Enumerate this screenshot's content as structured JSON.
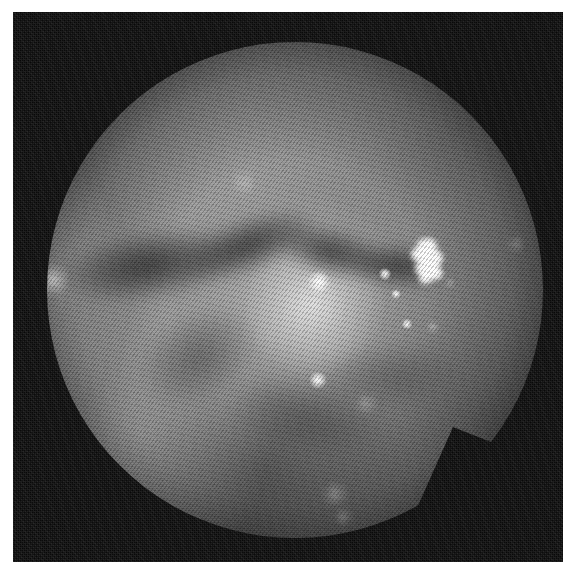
{
  "image": {
    "kind": "endoscopic-frame",
    "modality": "white-light endoscopy",
    "color_mode": "grayscale",
    "width": 575,
    "height": 574,
    "page_background": "#ffffff",
    "plate_background": "#0b0b0b",
    "tissue_base_color": "#939393",
    "highlight_color": "#ffffff",
    "shadow_color": "#181818"
  },
  "plate": {
    "left": 13,
    "top": 12,
    "width": 550,
    "height": 550
  },
  "field_of_view": {
    "shape": "circle-with-notch",
    "center_x": 282,
    "center_y": 278,
    "radius": 248,
    "notch": {
      "description": "angular wedge removed from the lower-right rim",
      "points": "440,415 478,430 462,470 498,452"
    }
  },
  "features": {
    "dark_bands": [
      {
        "name": "mucosal-fold-left",
        "x": 42,
        "y": 218,
        "w": 190,
        "h": 70,
        "rotate": -9
      },
      {
        "name": "mucosal-fold-mid",
        "x": 160,
        "y": 205,
        "w": 150,
        "h": 56,
        "rotate": -21
      },
      {
        "name": "mucosal-fold-crest",
        "x": 258,
        "y": 215,
        "w": 120,
        "h": 50,
        "rotate": 14
      },
      {
        "name": "mucosal-fold-right",
        "x": 330,
        "y": 232,
        "w": 110,
        "h": 44,
        "rotate": 6
      },
      {
        "name": "shadow-lower-left",
        "x": 120,
        "y": 300,
        "w": 130,
        "h": 90,
        "rotate": -30
      },
      {
        "name": "shadow-lower-center",
        "x": 215,
        "y": 365,
        "w": 160,
        "h": 80,
        "rotate": 10
      },
      {
        "name": "shadow-lower-right",
        "x": 300,
        "y": 330,
        "w": 150,
        "h": 70,
        "rotate": -6
      }
    ],
    "specular_spots": [
      {
        "name": "highlight-upper-faint",
        "x": 231,
        "y": 171,
        "size": 26,
        "class": "faint"
      },
      {
        "name": "highlight-left-rim",
        "x": 40,
        "y": 268,
        "size": 34,
        "class": "soft"
      },
      {
        "name": "highlight-center-bright",
        "x": 306,
        "y": 270,
        "size": 24,
        "class": ""
      },
      {
        "name": "highlight-mid-right-a",
        "x": 372,
        "y": 262,
        "size": 13,
        "class": ""
      },
      {
        "name": "highlight-mid-right-b",
        "x": 383,
        "y": 282,
        "size": 10,
        "class": ""
      },
      {
        "name": "highlight-small-right",
        "x": 394,
        "y": 312,
        "size": 11,
        "class": ""
      },
      {
        "name": "highlight-right-edge",
        "x": 437,
        "y": 271,
        "size": 9,
        "class": "soft"
      },
      {
        "name": "highlight-far-right",
        "x": 503,
        "y": 232,
        "size": 16,
        "class": "faint"
      },
      {
        "name": "highlight-below-center",
        "x": 420,
        "y": 315,
        "size": 12,
        "class": "soft"
      },
      {
        "name": "highlight-lower-center",
        "x": 305,
        "y": 368,
        "size": 18,
        "class": ""
      },
      {
        "name": "highlight-lower-soft",
        "x": 353,
        "y": 392,
        "size": 22,
        "class": "faint"
      },
      {
        "name": "highlight-bottom",
        "x": 322,
        "y": 482,
        "size": 26,
        "class": "faint"
      },
      {
        "name": "highlight-bottom-dim",
        "x": 330,
        "y": 505,
        "size": 18,
        "class": "faint"
      }
    ],
    "cluster_highlight": {
      "name": "saturated-reflection-cluster",
      "left": 396,
      "top": 226,
      "blobs": [
        {
          "x": 8,
          "y": 0,
          "w": 20,
          "h": 16
        },
        {
          "x": 2,
          "y": 9,
          "w": 17,
          "h": 15
        },
        {
          "x": 14,
          "y": 11,
          "w": 20,
          "h": 19
        },
        {
          "x": 6,
          "y": 22,
          "w": 22,
          "h": 17
        },
        {
          "x": 18,
          "y": 28,
          "w": 16,
          "h": 14
        },
        {
          "x": 10,
          "y": 34,
          "w": 14,
          "h": 12
        }
      ]
    }
  }
}
